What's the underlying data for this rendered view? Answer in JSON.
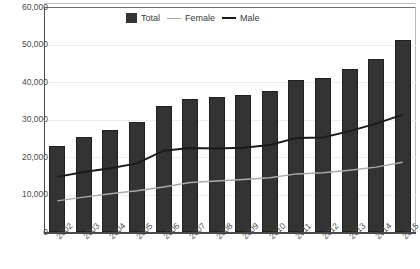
{
  "chart_data": {
    "type": "bar",
    "title": "",
    "xlabel": "",
    "ylabel": "",
    "ylim": [
      0,
      60000
    ],
    "ytick_labels": [
      "60,000",
      "50,000",
      "40,000",
      "30,000",
      "20,000",
      "10,000",
      "0"
    ],
    "ytick_values": [
      60000,
      50000,
      40000,
      30000,
      20000,
      10000,
      0
    ],
    "grid": true,
    "legend_position": "top-center",
    "categories": [
      "2002",
      "2003",
      "2004",
      "2005",
      "2006",
      "2007",
      "2008",
      "2009",
      "2010",
      "2011",
      "2012",
      "2013",
      "2014",
      "2015"
    ],
    "series": [
      {
        "name": "Total",
        "type": "bar",
        "color": "#333333",
        "values": [
          23000,
          25300,
          27200,
          29300,
          33700,
          35600,
          35900,
          36500,
          37700,
          40600,
          41000,
          43400,
          46200,
          51300
        ]
      },
      {
        "name": "Female",
        "type": "line",
        "color": "#aaaaaa",
        "values": [
          8300,
          9300,
          10200,
          11000,
          12000,
          13200,
          13600,
          14000,
          14500,
          15500,
          15800,
          16500,
          17300,
          18600
        ]
      },
      {
        "name": "Male",
        "type": "line",
        "color": "#1a1a1a",
        "values": [
          14700,
          16000,
          17000,
          18300,
          21700,
          22400,
          22300,
          22500,
          23200,
          25100,
          25200,
          26900,
          28900,
          31300
        ]
      }
    ]
  },
  "legend": {
    "total_label": "Total",
    "female_label": "Female",
    "male_label": "Male"
  }
}
